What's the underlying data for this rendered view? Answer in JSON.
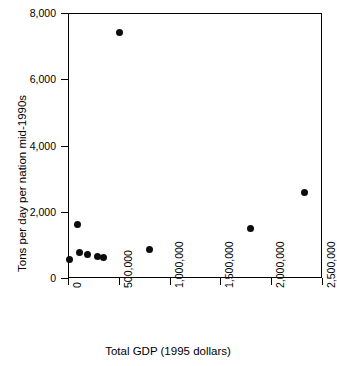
{
  "chart_data": {
    "type": "scatter",
    "title": "",
    "subtitle": "",
    "xlabel": "Total GDP (1995 dollars)",
    "ylabel": "Tons per day per nation mid-1990s",
    "xlim": [
      0,
      2500000
    ],
    "ylim": [
      0,
      8000
    ],
    "grid": false,
    "legend": null,
    "legend_position": "none",
    "marker": {
      "shape": "circle",
      "color": "#0d0d0d",
      "size_px": 7
    },
    "xticks": [
      {
        "value": 0,
        "label": "0"
      },
      {
        "value": 500000,
        "label": "500,000"
      },
      {
        "value": 1000000,
        "label": "1,000,000"
      },
      {
        "value": 1500000,
        "label": "1,500,000"
      },
      {
        "value": 2000000,
        "label": "2,000,000"
      },
      {
        "value": 2500000,
        "label": "2,500,000"
      }
    ],
    "yticks": [
      {
        "value": 0,
        "label": "0"
      },
      {
        "value": 2000,
        "label": "2,000"
      },
      {
        "value": 4000,
        "label": "4,000"
      },
      {
        "value": 6000,
        "label": "6,000"
      },
      {
        "value": 8000,
        "label": "8,000"
      }
    ],
    "points": [
      {
        "x": 10000,
        "y": 550
      },
      {
        "x": 90000,
        "y": 1620
      },
      {
        "x": 110000,
        "y": 760
      },
      {
        "x": 190000,
        "y": 700
      },
      {
        "x": 290000,
        "y": 640
      },
      {
        "x": 350000,
        "y": 620
      },
      {
        "x": 510000,
        "y": 7400
      },
      {
        "x": 800000,
        "y": 870
      },
      {
        "x": 1800000,
        "y": 1490
      },
      {
        "x": 2330000,
        "y": 2580
      }
    ]
  }
}
